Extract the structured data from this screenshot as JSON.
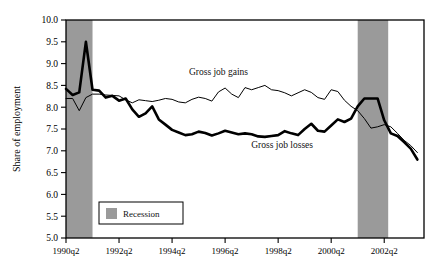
{
  "chart_data": {
    "type": "line",
    "title": "",
    "xlabel": "",
    "ylabel": "Share of employment",
    "ylim": [
      5.0,
      10.0
    ],
    "ytick_labels": [
      "10.0",
      "9.5",
      "9.0",
      "8.5",
      "8.0",
      "7.5",
      "7.0",
      "6.5",
      "6.0",
      "5.5",
      "5.0"
    ],
    "ytick_values": [
      10.0,
      9.5,
      9.0,
      8.5,
      8.0,
      7.5,
      7.0,
      6.5,
      6.0,
      5.5,
      5.0
    ],
    "xtick_labels": [
      "1990q2",
      "1992q2",
      "1994q2",
      "1996q2",
      "1998q2",
      "2000q2",
      "2002q2"
    ],
    "xtick_values": [
      1990.25,
      1992.25,
      1994.25,
      1996.25,
      1998.25,
      2000.25,
      2002.25
    ],
    "xlim": [
      1990.25,
      2003.75
    ],
    "grid": false,
    "legend_position": "inside-bottom-left",
    "legend_entries": [
      {
        "label": "Recession",
        "color": "#9a9a9a",
        "type": "band"
      }
    ],
    "annotations": [
      {
        "text": "Gross job gains",
        "x": 1996.0,
        "y": 8.73
      },
      {
        "text": "Gross job losses",
        "x": 1998.4,
        "y": 7.07
      }
    ],
    "shaded_regions": [
      {
        "label": "Recession",
        "x0": 1990.25,
        "x1": 1991.25,
        "color": "#9a9a9a"
      },
      {
        "label": "Recession",
        "x0": 2001.25,
        "x1": 2002.4,
        "color": "#9a9a9a"
      }
    ],
    "x": [
      1990.25,
      1990.5,
      1990.75,
      1991.0,
      1991.25,
      1991.5,
      1991.75,
      1992.0,
      1992.25,
      1992.5,
      1992.75,
      1993.0,
      1993.25,
      1993.5,
      1993.75,
      1994.0,
      1994.25,
      1994.5,
      1994.75,
      1995.0,
      1995.25,
      1995.5,
      1995.75,
      1996.0,
      1996.25,
      1996.5,
      1996.75,
      1997.0,
      1997.25,
      1997.5,
      1997.75,
      1998.0,
      1998.25,
      1998.5,
      1998.75,
      1999.0,
      1999.25,
      1999.5,
      1999.75,
      2000.0,
      2000.25,
      2000.5,
      2000.75,
      2001.0,
      2001.25,
      2001.5,
      2001.75,
      2002.0,
      2002.25,
      2002.5,
      2002.75,
      2003.0,
      2003.25,
      2003.5
    ],
    "series": [
      {
        "name": "Gross job gains",
        "style": "thin",
        "color": "#000000",
        "values": [
          8.2,
          8.2,
          7.92,
          8.22,
          8.3,
          8.3,
          8.28,
          8.27,
          8.26,
          8.17,
          8.1,
          8.17,
          8.15,
          8.13,
          8.16,
          8.2,
          8.18,
          8.12,
          8.1,
          8.18,
          8.23,
          8.2,
          8.14,
          8.35,
          8.44,
          8.3,
          8.22,
          8.45,
          8.4,
          8.45,
          8.5,
          8.4,
          8.38,
          8.33,
          8.26,
          8.33,
          8.4,
          8.34,
          8.22,
          8.18,
          8.4,
          8.36,
          8.16,
          8.02,
          7.92,
          7.74,
          7.52,
          7.55,
          7.6,
          7.55,
          7.4,
          7.24,
          7.12,
          6.96
        ]
      },
      {
        "name": "Gross job losses",
        "style": "thick",
        "color": "#000000",
        "values": [
          8.42,
          8.28,
          8.34,
          9.5,
          8.4,
          8.38,
          8.22,
          8.26,
          8.15,
          8.2,
          7.95,
          7.78,
          7.86,
          8.02,
          7.72,
          7.6,
          7.48,
          7.42,
          7.36,
          7.38,
          7.44,
          7.41,
          7.35,
          7.4,
          7.46,
          7.42,
          7.38,
          7.4,
          7.38,
          7.33,
          7.32,
          7.34,
          7.36,
          7.45,
          7.4,
          7.36,
          7.5,
          7.62,
          7.46,
          7.44,
          7.58,
          7.72,
          7.66,
          7.74,
          8.02,
          8.2,
          8.2,
          8.2,
          7.7,
          7.4,
          7.34,
          7.2,
          7.05,
          6.8
        ]
      }
    ]
  }
}
